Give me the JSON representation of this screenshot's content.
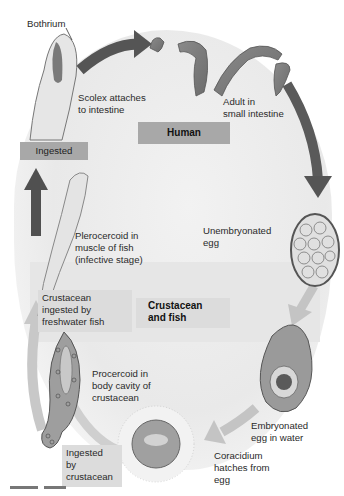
{
  "diagram": {
    "type": "life-cycle",
    "hosts": [
      {
        "id": "human",
        "label": "Human"
      },
      {
        "id": "crustacean-fish",
        "label": "Crustacean\nand fish"
      }
    ],
    "labels": {
      "bothrium": "Bothrium",
      "scolex": "Scolex attaches\nto intestine",
      "adult": "Adult in\nsmall intestine",
      "unembryonated": "Unembryonated\negg",
      "embryonated": "Embryonated\negg in water",
      "coracidium": "Coracidium\nhatches from\negg",
      "ingested_crustacean": "Ingested\nby\ncrustacean",
      "procercoid": "Procercoid in\nbody cavity of\ncrustacean",
      "crustacean_ingested": "Crustacean\ningested by\nfreshwater fish",
      "plerocercoid": "Plerocercoid in\nmuscle of fish\n(infective stage)",
      "ingested": "Ingested"
    },
    "stages_in_order": [
      "Scolex attaches to intestine",
      "Adult in small intestine",
      "Unembryonated egg",
      "Embryonated egg in water",
      "Coracidium hatches from egg",
      "Ingested by crustacean",
      "Procercoid in body cavity of crustacean",
      "Crustacean ingested by freshwater fish",
      "Plerocercoid in muscle of fish (infective stage)",
      "Ingested"
    ],
    "colors": {
      "dark_arrow": "#555555",
      "light_arrow": "#c4c4c4",
      "host_box_dark": "#a8a8a8",
      "host_box_light": "#dcdcdc",
      "background": "#ededed"
    }
  }
}
